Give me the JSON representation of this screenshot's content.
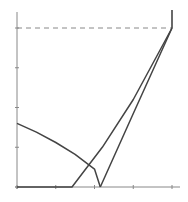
{
  "chart_data": {
    "type": "line",
    "title": "",
    "xlabel": "",
    "ylabel": "",
    "xlim": [
      0,
      4
    ],
    "ylim": [
      0,
      4
    ],
    "x_ticks": [
      0,
      1,
      2,
      3,
      4
    ],
    "y_ticks": [
      0,
      1,
      2,
      3,
      4
    ],
    "tick_labels_visible": false,
    "grid": false,
    "legend": null,
    "reference_lines": [
      {
        "type": "horizontal_dashed",
        "y": 4,
        "x_range": [
          0,
          4
        ]
      },
      {
        "type": "vertical_solid",
        "x": 4,
        "y_range": [
          4,
          4.45
        ]
      }
    ],
    "series": [
      {
        "name": "descending-curve",
        "style": "solid",
        "points": [
          [
            0,
            1.6
          ],
          [
            0.5,
            1.38
          ],
          [
            1.0,
            1.12
          ],
          [
            1.5,
            0.82
          ],
          [
            2.0,
            0.45
          ],
          [
            2.15,
            0
          ]
        ]
      },
      {
        "name": "floor-then-rise",
        "style": "solid",
        "points": [
          [
            0,
            0
          ],
          [
            1.42,
            0
          ],
          [
            2.2,
            1.0
          ],
          [
            3.0,
            2.2
          ],
          [
            4,
            4
          ]
        ]
      },
      {
        "name": "steep-rise",
        "style": "solid",
        "points": [
          [
            2.15,
            0
          ],
          [
            3.0,
            1.85
          ],
          [
            4,
            4
          ]
        ]
      }
    ],
    "colors": {
      "lines": "#444444",
      "axis": "#888888",
      "dash": "#888888"
    }
  }
}
